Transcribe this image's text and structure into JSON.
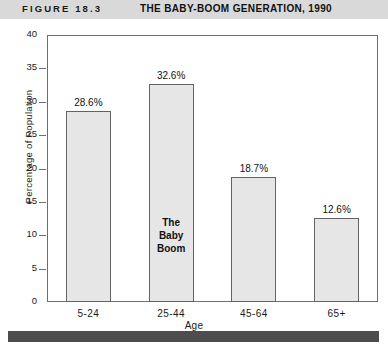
{
  "header": {
    "figure_number": "FIGURE 18.3",
    "title": "THE BABY-BOOM GENERATION, 1990",
    "band_color": "#d9d9d9"
  },
  "chart_data": {
    "type": "bar",
    "title": "THE BABY-BOOM GENERATION, 1990",
    "xlabel": "Age",
    "ylabel": "Percentage of Population",
    "categories": [
      "5-24",
      "25-44",
      "45-64",
      "65+"
    ],
    "values": [
      28.6,
      32.6,
      18.7,
      12.6
    ],
    "value_labels": [
      "28.6%",
      "32.6%",
      "18.7%",
      "12.6%"
    ],
    "ylim": [
      0,
      40
    ],
    "ytick_labels": [
      "40",
      "35",
      "30",
      "25",
      "20",
      "15",
      "10",
      "5",
      "0"
    ],
    "ytick_values": [
      40,
      35,
      30,
      25,
      20,
      15,
      10,
      5,
      0
    ],
    "grid": false,
    "legend": null,
    "annotations": [
      {
        "text": "The Baby Boom",
        "lines": [
          "The",
          "Baby",
          "Boom"
        ],
        "category": "25-44"
      }
    ],
    "bar_fill_color": "#e6e6e6",
    "bar_edge_color": "#636363"
  },
  "footer": {
    "rule_color": "#4d4d4d"
  }
}
